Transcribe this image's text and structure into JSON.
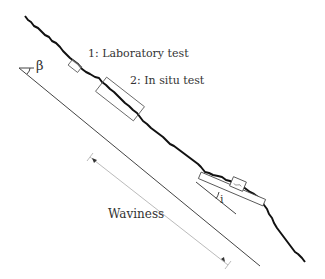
{
  "diagram": {
    "labels": {
      "laboratory_test": "1: Laboratory test",
      "in_situ_test": "2: In situ test",
      "waviness": "Waviness",
      "slope_angle": "β",
      "roughness_angle": "i"
    },
    "colors": {
      "joint_profile": "#111111",
      "lines": "#444444",
      "dimension": "#bbbbbb",
      "text": "#333333"
    }
  }
}
